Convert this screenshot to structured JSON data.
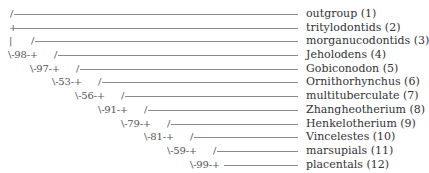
{
  "line_end_x": 298,
  "rows": [
    {
      "node": "",
      "node_x": 0,
      "slash": "/",
      "slash_x": 10,
      "line_start": 14,
      "label": "outgroup (1)"
    },
    {
      "node": "+",
      "node_x": 9,
      "slash": "",
      "slash_x": 0,
      "line_start": 13,
      "label": "tritylodontids (2)"
    },
    {
      "node": "|",
      "node_x": 9,
      "slash": "/",
      "slash_x": 31,
      "line_start": 35,
      "label": "morganucodontids (3)"
    },
    {
      "node": "\\-98-+",
      "node_x": 8,
      "slash": "/",
      "slash_x": 54,
      "line_start": 58,
      "label": "Jeholodens (4)"
    },
    {
      "node": "\\-97-+",
      "node_x": 30,
      "slash": "/",
      "slash_x": 76,
      "line_start": 80,
      "label": "Gobiconodon (5)"
    },
    {
      "node": "\\-53-+",
      "node_x": 52,
      "slash": "/",
      "slash_x": 98,
      "line_start": 102,
      "label": "Ornithorhynchus (6)"
    },
    {
      "node": "\\-56-+",
      "node_x": 75,
      "slash": "/",
      "slash_x": 121,
      "line_start": 125,
      "label": "multituberculate (7)"
    },
    {
      "node": "\\-91-+",
      "node_x": 98,
      "slash": "/",
      "slash_x": 144,
      "line_start": 148,
      "label": "Zhangheotherium (8)"
    },
    {
      "node": "\\-79-+",
      "node_x": 121,
      "slash": "/",
      "slash_x": 167,
      "line_start": 171,
      "label": "Henkelotherium (9)"
    },
    {
      "node": "\\-81-+",
      "node_x": 144,
      "slash": "/",
      "slash_x": 190,
      "line_start": 194,
      "label": "Vincelestes (10)"
    },
    {
      "node": "\\-59-+",
      "node_x": 167,
      "slash": "/",
      "slash_x": 213,
      "line_start": 217,
      "label": "marsupials (11)"
    },
    {
      "node": "\\-99-+",
      "node_x": 190,
      "slash": "",
      "slash_x": 0,
      "line_start": 224,
      "label": "placentals (12)"
    }
  ]
}
